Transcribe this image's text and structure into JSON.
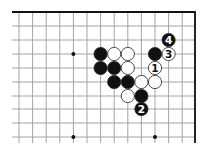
{
  "diagram": {
    "type": "go-board-fragment",
    "colors": {
      "background": "#ffffff",
      "grid": "#9a9a9a",
      "edge": "#111111",
      "black_stone": "#111111",
      "white_stone": "#ffffff",
      "stone_outline": "#222222"
    },
    "grid": {
      "x": [
        19,
        32.6,
        46.2,
        59.8,
        73.4,
        87,
        100.6,
        114.2,
        127.8,
        141.4,
        155,
        168.6,
        182.2,
        195
      ],
      "y": [
        12,
        26,
        40,
        54,
        68,
        82,
        96,
        109,
        123,
        137
      ],
      "left_extent": 12,
      "bottom_extent": 143,
      "top_edge": true,
      "right_edge": true
    },
    "star_points": [
      {
        "col": 4,
        "row": 3
      },
      {
        "col": 4,
        "row": 9
      },
      {
        "col": 10,
        "row": 9
      }
    ],
    "stones": [
      {
        "col": 6,
        "row": 3,
        "color": "black",
        "label": ""
      },
      {
        "col": 7,
        "row": 3,
        "color": "white",
        "label": ""
      },
      {
        "col": 8,
        "row": 3,
        "color": "white",
        "label": ""
      },
      {
        "col": 10,
        "row": 3,
        "color": "black",
        "label": ""
      },
      {
        "col": 11,
        "row": 3,
        "color": "white",
        "label": "3"
      },
      {
        "col": 11,
        "row": 2,
        "color": "black",
        "label": "4"
      },
      {
        "col": 6,
        "row": 4,
        "color": "black",
        "label": ""
      },
      {
        "col": 7,
        "row": 4,
        "color": "black",
        "label": ""
      },
      {
        "col": 8,
        "row": 4,
        "color": "white",
        "label": ""
      },
      {
        "col": 10,
        "row": 4,
        "color": "white",
        "label": "1"
      },
      {
        "col": 7,
        "row": 5,
        "color": "black",
        "label": ""
      },
      {
        "col": 8,
        "row": 5,
        "color": "black",
        "label": ""
      },
      {
        "col": 9,
        "row": 5,
        "color": "white",
        "label": ""
      },
      {
        "col": 10,
        "row": 5,
        "color": "white",
        "label": ""
      },
      {
        "col": 8,
        "row": 6,
        "color": "white",
        "label": ""
      },
      {
        "col": 9,
        "row": 6,
        "color": "black",
        "label": ""
      },
      {
        "col": 9,
        "row": 7,
        "color": "black",
        "label": "2"
      }
    ]
  }
}
